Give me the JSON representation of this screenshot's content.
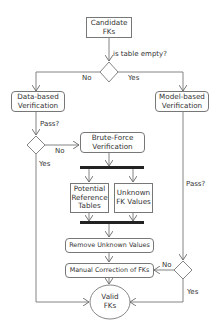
{
  "diagram": {
    "type": "flowchart",
    "nodes": {
      "candidate": "Candidate\nFKs",
      "data_based": "Data-based\nVerification",
      "model_based": "Model-based\nVerification",
      "brute_force": "Brute-Force\nVerification",
      "potential_tables": "Potential\nReference\nTables",
      "unknown_values": "Unknown\nFK Values",
      "remove_unknown": "Remove Unknown Values",
      "manual_correction": "Manual Correction of FKs",
      "valid": "Valid\nFKs"
    },
    "labels": {
      "is_table_empty": "is table empty?",
      "top_no": "No",
      "top_yes": "Yes",
      "left_pass": "Pass?",
      "left_no": "No",
      "left_yes": "Yes",
      "right_pass": "Pass?",
      "right_no": "No",
      "right_yes": "Yes"
    },
    "edges": [
      {
        "from": "candidate",
        "to": "decision-empty"
      },
      {
        "from": "decision-empty",
        "to": "data_based",
        "label": "No"
      },
      {
        "from": "decision-empty",
        "to": "model_based",
        "label": "Yes"
      },
      {
        "from": "data_based",
        "to": "decision-data-pass",
        "label": "Pass?"
      },
      {
        "from": "decision-data-pass",
        "to": "brute_force",
        "label": "No"
      },
      {
        "from": "decision-data-pass",
        "to": "valid",
        "label": "Yes"
      },
      {
        "from": "brute_force",
        "to": "fork-bar"
      },
      {
        "from": "fork-bar",
        "to": "potential_tables"
      },
      {
        "from": "fork-bar",
        "to": "unknown_values"
      },
      {
        "from": "potential_tables",
        "to": "join-bar"
      },
      {
        "from": "unknown_values",
        "to": "join-bar"
      },
      {
        "from": "join-bar",
        "to": "remove_unknown"
      },
      {
        "from": "remove_unknown",
        "to": "manual_correction"
      },
      {
        "from": "manual_correction",
        "to": "valid"
      },
      {
        "from": "model_based",
        "to": "decision-model-pass",
        "label": "Pass?"
      },
      {
        "from": "decision-model-pass",
        "to": "manual_correction",
        "label": "No"
      },
      {
        "from": "decision-model-pass",
        "to": "valid",
        "label": "Yes"
      }
    ]
  }
}
